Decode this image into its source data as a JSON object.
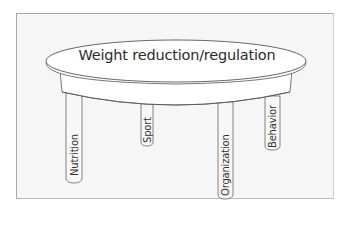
{
  "diagram": {
    "title": "Weight reduction/regulation",
    "legs": [
      {
        "label": "Nutrition"
      },
      {
        "label": "Sport"
      },
      {
        "label": "Organization"
      },
      {
        "label": "Behavior"
      }
    ]
  },
  "colors": {
    "background": "#f6f6f6",
    "stroke": "#555555",
    "table_fill": "#ffffff"
  }
}
